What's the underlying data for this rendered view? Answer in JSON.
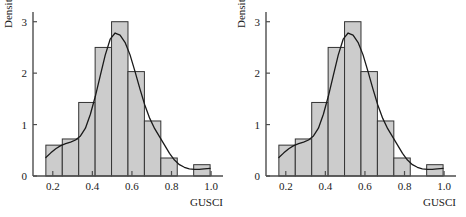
{
  "figure": {
    "panel_count": 2,
    "background_color": "#ffffff",
    "bar_fill_color": "#cccccc",
    "bar_edge_color": "#333333",
    "curve_color": "#1a1a1a",
    "axis_color": "#4d4d4d",
    "text_color": "#1a1a1a"
  },
  "panels": [
    {
      "name": "left-histogram",
      "chart_data": {
        "type": "bar",
        "title": "",
        "subtitle": "",
        "xlabel": "GUSCI",
        "ylabel": "Density",
        "xlim": [
          0.1,
          1.04
        ],
        "ylim": [
          0,
          3.15
        ],
        "xticks": [
          0.2,
          0.4,
          0.6,
          0.8,
          1.0
        ],
        "xtick_labels": [
          "0.2",
          "0.4",
          "0.6",
          "0.8",
          "1.0"
        ],
        "yticks": [
          0,
          1,
          2,
          3
        ],
        "ytick_labels": [
          "0",
          "1",
          "2",
          "3"
        ],
        "grid": false,
        "legend": null,
        "bin_edges": [
          0.165,
          0.248,
          0.331,
          0.414,
          0.497,
          0.58,
          0.663,
          0.746,
          0.829,
          0.912,
          0.995
        ],
        "categories": [
          "0.165-0.248",
          "0.248-0.331",
          "0.331-0.414",
          "0.414-0.497",
          "0.497-0.580",
          "0.580-0.663",
          "0.663-0.746",
          "0.746-0.829",
          "0.829-0.912",
          "0.912-0.995"
        ],
        "values": [
          0.6,
          0.72,
          1.43,
          2.5,
          3.0,
          2.03,
          1.07,
          0.35,
          0.0,
          0.22
        ],
        "overlay_curve": {
          "name": "kernel density estimate",
          "x": [
            0.165,
            0.19,
            0.215,
            0.24,
            0.265,
            0.29,
            0.315,
            0.34,
            0.365,
            0.39,
            0.415,
            0.44,
            0.465,
            0.49,
            0.515,
            0.54,
            0.565,
            0.59,
            0.615,
            0.64,
            0.665,
            0.69,
            0.715,
            0.74,
            0.765,
            0.79,
            0.815,
            0.84,
            0.865,
            0.89,
            0.915,
            0.94,
            0.965,
            0.995
          ],
          "y": [
            0.36,
            0.45,
            0.53,
            0.59,
            0.63,
            0.66,
            0.7,
            0.78,
            0.93,
            1.2,
            1.55,
            1.95,
            2.35,
            2.66,
            2.78,
            2.74,
            2.6,
            2.36,
            2.04,
            1.7,
            1.38,
            1.12,
            0.92,
            0.76,
            0.6,
            0.44,
            0.31,
            0.22,
            0.17,
            0.14,
            0.13,
            0.13,
            0.14,
            0.15
          ]
        }
      }
    },
    {
      "name": "right-histogram",
      "chart_data": {
        "type": "bar",
        "title": "",
        "subtitle": "",
        "xlabel": "GUSCI",
        "ylabel": "Density",
        "xlim": [
          0.1,
          1.04
        ],
        "ylim": [
          0,
          3.15
        ],
        "xticks": [
          0.2,
          0.4,
          0.6,
          0.8,
          1.0
        ],
        "xtick_labels": [
          "0.2",
          "0.4",
          "0.6",
          "0.8",
          "1.0"
        ],
        "yticks": [
          0,
          1,
          2,
          3
        ],
        "ytick_labels": [
          "0",
          "1",
          "2",
          "3"
        ],
        "grid": false,
        "legend": null,
        "bin_edges": [
          0.165,
          0.248,
          0.331,
          0.414,
          0.497,
          0.58,
          0.663,
          0.746,
          0.829,
          0.912,
          0.995
        ],
        "categories": [
          "0.165-0.248",
          "0.248-0.331",
          "0.331-0.414",
          "0.414-0.497",
          "0.497-0.580",
          "0.580-0.663",
          "0.663-0.746",
          "0.746-0.829",
          "0.829-0.912",
          "0.912-0.995"
        ],
        "values": [
          0.6,
          0.72,
          1.43,
          2.5,
          3.0,
          2.03,
          1.07,
          0.35,
          0.0,
          0.22
        ],
        "overlay_curve": {
          "name": "kernel density estimate",
          "x": [
            0.165,
            0.19,
            0.215,
            0.24,
            0.265,
            0.29,
            0.315,
            0.34,
            0.365,
            0.39,
            0.415,
            0.44,
            0.465,
            0.49,
            0.515,
            0.54,
            0.565,
            0.59,
            0.615,
            0.64,
            0.665,
            0.69,
            0.715,
            0.74,
            0.765,
            0.79,
            0.815,
            0.84,
            0.865,
            0.89,
            0.915,
            0.94,
            0.965,
            0.995
          ],
          "y": [
            0.36,
            0.45,
            0.53,
            0.59,
            0.63,
            0.66,
            0.7,
            0.78,
            0.93,
            1.2,
            1.55,
            1.95,
            2.35,
            2.66,
            2.78,
            2.74,
            2.6,
            2.36,
            2.04,
            1.7,
            1.38,
            1.12,
            0.92,
            0.76,
            0.6,
            0.44,
            0.31,
            0.22,
            0.17,
            0.14,
            0.13,
            0.13,
            0.14,
            0.15
          ]
        }
      }
    }
  ]
}
